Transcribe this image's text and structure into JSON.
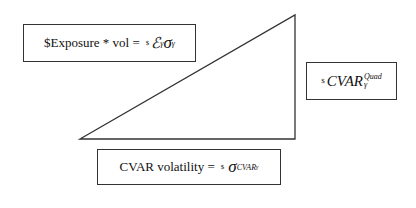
{
  "diagram": {
    "triangle": {
      "points": [
        [
          80,
          139
        ],
        [
          295,
          15
        ],
        [
          295,
          139
        ]
      ],
      "stroke": "#333333"
    },
    "boxes": {
      "exposure": {
        "label": "$Exposure * vol =",
        "formula_sup": "$",
        "formula_symbol1": "ℰ",
        "formula_sub1": "γ",
        "formula_symbol2": "σ",
        "formula_sub2": "γ"
      },
      "cvar_quad": {
        "formula_sup": "$",
        "formula_main": "CVAR",
        "formula_superscript": "Quad",
        "formula_subscript": "γ"
      },
      "cvar_volatility": {
        "label": "CVAR volatility =",
        "formula_sup": "$",
        "formula_symbol": "σ",
        "formula_sub": "CVAR",
        "formula_subsub": "γ"
      }
    }
  }
}
